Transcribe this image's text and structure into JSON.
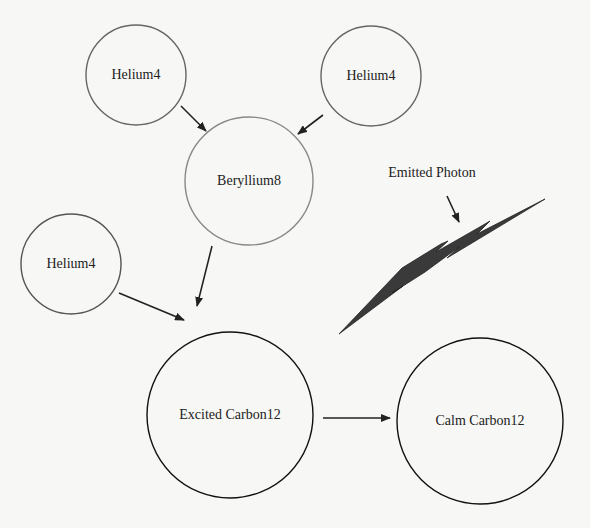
{
  "diagram": {
    "nodes": [
      {
        "id": "helium4_a",
        "label": "Helium4",
        "cx": 136,
        "cy": 75,
        "r": 50,
        "stroke": "#666666"
      },
      {
        "id": "helium4_b",
        "label": "Helium4",
        "cx": 371,
        "cy": 76,
        "r": 50,
        "stroke": "#666666"
      },
      {
        "id": "beryllium8",
        "label": "Beryllium8",
        "cx": 249,
        "cy": 181,
        "r": 64,
        "stroke": "#888888"
      },
      {
        "id": "helium4_c",
        "label": "Helium4",
        "cx": 71,
        "cy": 264,
        "r": 50,
        "stroke": "#555555"
      },
      {
        "id": "excited_carbon12",
        "label": "Excited Carbon12",
        "cx": 230,
        "cy": 415,
        "r": 83,
        "stroke": "#111111"
      },
      {
        "id": "calm_carbon12",
        "label": "Calm Carbon12",
        "cx": 480,
        "cy": 421,
        "r": 83,
        "stroke": "#111111"
      }
    ],
    "edges": [
      {
        "from": "helium4_a",
        "to": "beryllium8",
        "x1": 181,
        "y1": 106,
        "x2": 206,
        "y2": 131
      },
      {
        "from": "helium4_b",
        "to": "beryllium8",
        "x1": 323,
        "y1": 115,
        "x2": 298,
        "y2": 134
      },
      {
        "from": "beryllium8",
        "to": "excited_carbon12",
        "x1": 212,
        "y1": 246,
        "x2": 197,
        "y2": 306
      },
      {
        "from": "helium4_c",
        "to": "excited_carbon12",
        "x1": 119,
        "y1": 293,
        "x2": 184,
        "y2": 320
      },
      {
        "from": "excited_carbon12",
        "to": "calm_carbon12",
        "x1": 323,
        "y1": 418,
        "x2": 390,
        "y2": 418
      }
    ],
    "annotations": [
      {
        "id": "emitted_photon",
        "label": "Emitted Photon",
        "x": 432,
        "y": 173,
        "arrow": {
          "x1": 447,
          "y1": 196,
          "x2": 459,
          "y2": 222
        }
      }
    ],
    "photon": {
      "fill": "#3a3a3a",
      "points": "339,334 402,268 441,244 448,241 436,252 478,228 490,221 477,234 545,199 472,243 447,258 459,247 425,272 392,293 403,286 339,334"
    }
  }
}
